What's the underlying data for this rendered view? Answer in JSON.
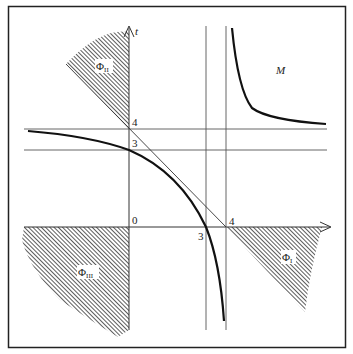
{
  "diagram": {
    "axis_labels": {
      "vertical": "t",
      "origin": "0"
    },
    "tick_labels": {
      "t4": "4",
      "t3": "3",
      "s3": "3",
      "s4": "4"
    },
    "region_labels": {
      "phi_ii": {
        "base": "Φ",
        "sub": "II"
      },
      "phi_iii": {
        "base": "Φ",
        "sub": "III"
      },
      "phi_i": {
        "base": "Φ",
        "sub": "I"
      },
      "m": "M"
    },
    "colors": {
      "line": "#222222",
      "thin_line": "#555555",
      "hatch": "#333333",
      "background": "#ffffff"
    }
  }
}
